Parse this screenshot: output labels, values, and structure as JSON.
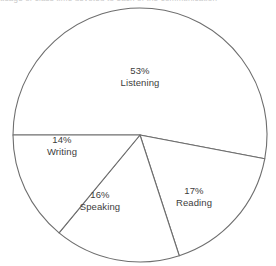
{
  "caption": {
    "top_sliver_text": "usage of class time devoted to each of the communication"
  },
  "chart_data": {
    "type": "pie",
    "title": "",
    "subtitle": "",
    "xlabel": "",
    "ylabel": "",
    "grid": false,
    "legend_position": "none",
    "label_style": "inside-slice",
    "value_suffix": "%",
    "categories": [
      "Listening",
      "Reading",
      "Speaking",
      "Writing"
    ],
    "values": [
      53,
      17,
      16,
      14
    ],
    "slices": [
      {
        "name": "Listening",
        "value": 53,
        "value_label": "53%",
        "category_label": "Listening",
        "start_angle_deg": 180,
        "end_angle_deg": 370.8,
        "fill": "#ffffff",
        "stroke": "#6e6e6e",
        "label_x": 140,
        "label_y": 76
      },
      {
        "name": "Reading",
        "value": 17,
        "value_label": "17%",
        "category_label": "Reading",
        "start_angle_deg": 10.8,
        "end_angle_deg": 72.0,
        "fill": "#ffffff",
        "stroke": "#6e6e6e",
        "label_x": 194,
        "label_y": 196
      },
      {
        "name": "Speaking",
        "value": 16,
        "value_label": "16%",
        "category_label": "Speaking",
        "start_angle_deg": 72.0,
        "end_angle_deg": 129.6,
        "fill": "#ffffff",
        "stroke": "#6e6e6e",
        "label_x": 100,
        "label_y": 200
      },
      {
        "name": "Writing",
        "value": 14,
        "value_label": "14%",
        "category_label": "Writing",
        "start_angle_deg": 129.6,
        "end_angle_deg": 180,
        "fill": "#ffffff",
        "stroke": "#6e6e6e",
        "label_x": 62,
        "label_y": 145
      }
    ],
    "geometry": {
      "center_x": 140,
      "center_y": 135,
      "radius": 127
    },
    "colors": {
      "background": "#ffffff",
      "outline": "#6e6e6e",
      "text": "#3d3d3d"
    }
  }
}
